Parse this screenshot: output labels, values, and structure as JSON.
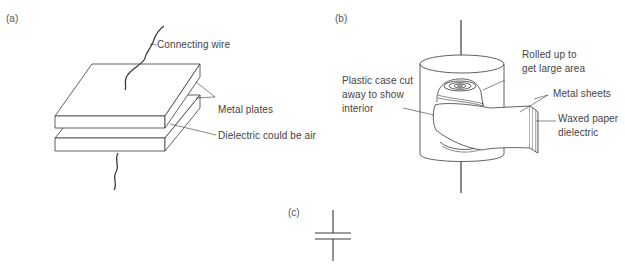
{
  "panels": {
    "a": {
      "tag": "(a)",
      "labels": {
        "connecting_wire": "Connecting wire",
        "metal_plates": "Metal plates",
        "dielectric": "Dielectric could be air"
      }
    },
    "b": {
      "tag": "(b)",
      "labels": {
        "rolled_line1": "Rolled up to",
        "rolled_line2": "get large area",
        "case_line1": "Plastic case cut",
        "case_line2": "away to show",
        "case_line3": "interior",
        "metal_sheets": "Metal sheets",
        "waxed_line1": "Waxed paper",
        "waxed_line2": "dielectric"
      }
    },
    "c": {
      "tag": "(c)"
    }
  },
  "colors": {
    "line": "#3a3a3a",
    "text": "#444444",
    "background": "#ffffff"
  }
}
